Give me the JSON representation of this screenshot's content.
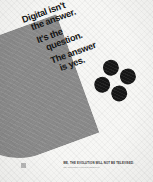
{
  "poster": {
    "background_color": "#f7f7f5",
    "headline_color": "#141414",
    "accent_gray": "#8d8d8d",
    "dot_color": "#161616",
    "registration_mark_color": "#b9b9b9",
    "headline_blocks": [
      {
        "line1": "Digital isn't",
        "line2": "the answer."
      },
      {
        "line1": "It's the",
        "line2": "question."
      },
      {
        "line1": "The answer",
        "line2": "is yes."
      }
    ],
    "dots": [
      {
        "name": "dot-top"
      },
      {
        "name": "dot-left"
      },
      {
        "name": "dot-right"
      },
      {
        "name": "dot-bottom"
      }
    ],
    "caption": {
      "main": "WE. THE EVOLUTION WILL NOT BE TELEVISED.",
      "sub": "The information revolution starts here."
    }
  }
}
